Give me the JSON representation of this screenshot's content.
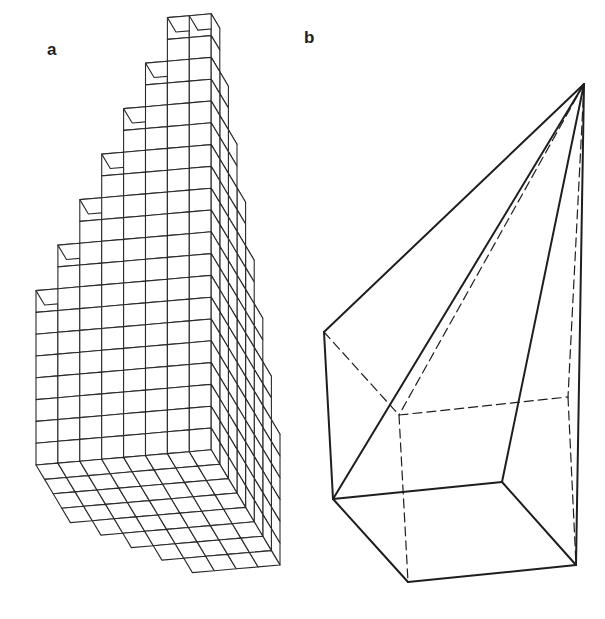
{
  "panels": {
    "a": {
      "label": "a",
      "description": "Stepped voxel staircase solid drawn as a cube grid",
      "origin": [
        36,
        465
      ],
      "unit_u": [
        21.9,
        -1.9
      ],
      "unit_v": [
        8.6,
        14.4
      ],
      "unit_w": [
        0,
        -21.8
      ],
      "grid_u": 8,
      "grid_v": 8,
      "heights_front": [
        8,
        10,
        12,
        14,
        16,
        18,
        20,
        20
      ],
      "step_drop_per_depth": 2,
      "min_height": 0,
      "stroke_color": "#2a2a2a"
    },
    "b": {
      "label": "b",
      "description": "Pyramid-like solid inscribed in a box; hidden edges dashed",
      "apex": [
        584,
        84
      ],
      "vertices": {
        "A": [
          324,
          332
        ],
        "B": [
          333,
          499
        ],
        "C": [
          408,
          582
        ],
        "D": [
          576,
          565
        ],
        "E": [
          502,
          482
        ],
        "F": [
          399,
          415
        ],
        "G": [
          568,
          397
        ]
      },
      "solid_edges": [
        [
          "apex",
          "A"
        ],
        [
          "apex",
          "B"
        ],
        [
          "apex",
          "E"
        ],
        [
          "apex",
          "D"
        ],
        [
          "A",
          "B"
        ],
        [
          "B",
          "C"
        ],
        [
          "C",
          "D"
        ],
        [
          "B",
          "E"
        ],
        [
          "E",
          "D"
        ]
      ],
      "dashed_edges": [
        [
          "A",
          "F"
        ],
        [
          "F",
          "G"
        ],
        [
          "F",
          "C"
        ],
        [
          "G",
          "D"
        ],
        [
          "apex",
          "F"
        ],
        [
          "apex",
          "G"
        ]
      ],
      "stroke_color": "#1e1e1e"
    }
  }
}
